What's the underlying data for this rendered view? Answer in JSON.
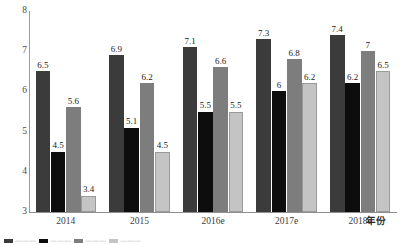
{
  "chart_data": {
    "type": "bar",
    "title": "",
    "subtitle": "",
    "xlabel": "年份",
    "ylabel": "",
    "ylim": [
      3,
      8
    ],
    "ytick_values": [
      3,
      4,
      5,
      6,
      7,
      8
    ],
    "ytick_labels": [
      "3",
      "4",
      "5",
      "6",
      "7",
      "8"
    ],
    "grid": false,
    "legend_position": "bottom",
    "categories": [
      "2014",
      "2015",
      "2016e",
      "2017e",
      "2018e"
    ],
    "series": [
      {
        "name": "series-1",
        "color": "#3b3b3b",
        "values": [
          6.5,
          6.9,
          7.1,
          7.3,
          7.4
        ],
        "labels": [
          "6.5",
          "6.9",
          "7.1",
          "7.3",
          "7.4"
        ]
      },
      {
        "name": "series-2",
        "color": "#0d0d0d",
        "values": [
          4.5,
          5.1,
          5.5,
          6.0,
          6.2
        ],
        "labels": [
          "4.5",
          "5.1",
          "5.5",
          "6",
          "6.2"
        ]
      },
      {
        "name": "series-3",
        "color": "#7d7d7d",
        "values": [
          5.6,
          6.2,
          6.6,
          6.8,
          7.0
        ],
        "labels": [
          "5.6",
          "6.2",
          "6.6",
          "6.8",
          "7"
        ]
      },
      {
        "name": "series-4",
        "color": "#c4c4c4",
        "values": [
          3.4,
          4.5,
          5.5,
          6.2,
          6.5
        ],
        "labels": [
          "3.4",
          "4.5",
          "5.5",
          "6.2",
          "6.5"
        ]
      }
    ]
  }
}
